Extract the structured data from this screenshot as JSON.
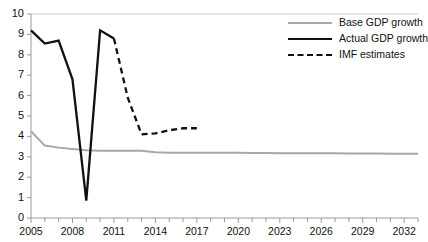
{
  "chart_data": {
    "type": "line",
    "title": "",
    "xlabel": "",
    "ylabel": "",
    "xlim": [
      2005,
      2033
    ],
    "ylim": [
      0,
      10
    ],
    "grid": false,
    "legend_position": "top-right",
    "y_ticks": [
      "0",
      "1",
      "2",
      "3",
      "4",
      "5",
      "6",
      "7",
      "8",
      "9",
      "10"
    ],
    "x_ticks": [
      "2005",
      "2008",
      "2011",
      "2014",
      "2017",
      "2020",
      "2023",
      "2026",
      "2029",
      "2032"
    ],
    "x_tick_years": [
      2005,
      2008,
      2011,
      2014,
      2017,
      2020,
      2023,
      2026,
      2029,
      2032
    ],
    "x_minor_years": [
      2005,
      2006,
      2007,
      2008,
      2009,
      2010,
      2011,
      2012,
      2013,
      2014,
      2015,
      2016,
      2017,
      2018,
      2019,
      2020,
      2021,
      2022,
      2023,
      2024,
      2025,
      2026,
      2027,
      2028,
      2029,
      2030,
      2031,
      2032,
      2033
    ],
    "series": [
      {
        "name": "Base GDP growth",
        "style": "solid",
        "color": "#a8a8a8",
        "width": 2,
        "x": [
          2005,
          2006,
          2007,
          2008,
          2009,
          2010,
          2011,
          2012,
          2013,
          2014,
          2015,
          2016,
          2017,
          2018,
          2019,
          2020,
          2021,
          2022,
          2023,
          2024,
          2025,
          2026,
          2027,
          2028,
          2029,
          2030,
          2031,
          2032,
          2033
        ],
        "values": [
          4.25,
          3.55,
          3.45,
          3.38,
          3.32,
          3.3,
          3.3,
          3.3,
          3.3,
          3.22,
          3.2,
          3.2,
          3.2,
          3.2,
          3.2,
          3.2,
          3.19,
          3.19,
          3.18,
          3.18,
          3.18,
          3.17,
          3.17,
          3.16,
          3.16,
          3.16,
          3.15,
          3.15,
          3.15
        ]
      },
      {
        "name": "Actual GDP growth",
        "style": "solid",
        "color": "#111111",
        "width": 2.3,
        "x": [
          2005,
          2006,
          2007,
          2008,
          2009,
          2010,
          2011
        ],
        "values": [
          9.2,
          8.55,
          8.7,
          6.8,
          0.85,
          9.2,
          8.8
        ]
      },
      {
        "name": "IMF estimates",
        "style": "dashed",
        "color": "#111111",
        "width": 2.3,
        "x": [
          2011,
          2012,
          2013,
          2014,
          2015,
          2016,
          2017
        ],
        "values": [
          8.8,
          5.9,
          4.1,
          4.15,
          4.3,
          4.4,
          4.4
        ]
      }
    ]
  },
  "legend": {
    "items": [
      {
        "label": "Base GDP growth",
        "icon": "solid-gray-line-icon"
      },
      {
        "label": "Actual GDP growth",
        "icon": "solid-black-line-icon"
      },
      {
        "label": "IMF estimates",
        "icon": "dashed-black-line-icon"
      }
    ]
  }
}
